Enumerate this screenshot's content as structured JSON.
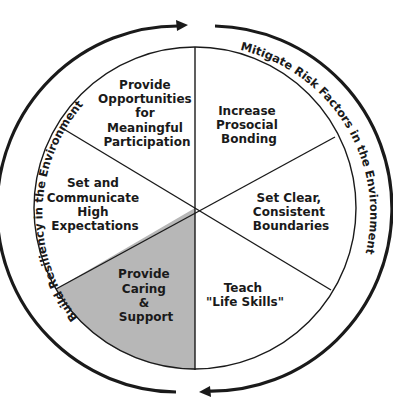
{
  "diagram": {
    "type": "circular-wheel",
    "colors": {
      "line": "#1a1a1a",
      "shaded_segment": "#b7b7b7",
      "background": "#ffffff"
    },
    "outer_arcs": {
      "left": {
        "label": "Build Resiliency in the Environment",
        "direction": "clockwise (up the left side, arrow at top)"
      },
      "right": {
        "label": "Mitigate Risk Factors in the Environment",
        "direction": "clockwise (down the right side, arrow at bottom)"
      }
    },
    "segments": [
      {
        "id": "top-left",
        "lines": [
          "Provide",
          "Opportunities",
          "for",
          "Meaningful",
          "Participation"
        ],
        "shaded": false
      },
      {
        "id": "top-right",
        "lines": [
          "Increase",
          "Prosocial",
          "Bonding"
        ],
        "shaded": false
      },
      {
        "id": "right",
        "lines": [
          "Set Clear,",
          "Consistent",
          "Boundaries"
        ],
        "shaded": false
      },
      {
        "id": "bottom-right",
        "lines": [
          "Teach",
          "\"Life Skills\""
        ],
        "shaded": false
      },
      {
        "id": "bottom-left",
        "lines": [
          "Provide",
          "Caring",
          "&",
          "Support"
        ],
        "shaded": true
      },
      {
        "id": "left",
        "lines": [
          "Set and",
          "Communicate",
          "High",
          "Expectations"
        ],
        "shaded": false
      }
    ]
  }
}
